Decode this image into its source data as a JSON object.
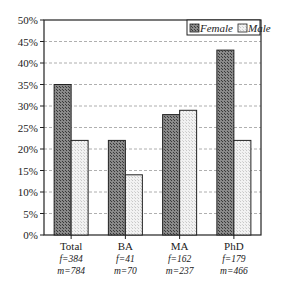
{
  "chart_data": {
    "type": "bar",
    "title": "",
    "xlabel": "",
    "ylabel": "",
    "ylim": [
      0,
      50
    ],
    "yticks": [
      "0%",
      "5%",
      "10%",
      "15%",
      "20%",
      "25%",
      "30%",
      "35%",
      "40%",
      "45%",
      "50%"
    ],
    "grid": true,
    "legend_position": "top-right",
    "categories": [
      "Total",
      "BA",
      "MA",
      "PhD"
    ],
    "category_notes": [
      [
        "f=384",
        "m=784"
      ],
      [
        "f=41",
        "m=70"
      ],
      [
        "f=162",
        "m=237"
      ],
      [
        "f=179",
        "m=466"
      ]
    ],
    "series": [
      {
        "name": "Female",
        "values": [
          35,
          22,
          28,
          43
        ],
        "color": "#6e6e6e"
      },
      {
        "name": "Male",
        "values": [
          22,
          14,
          29,
          22
        ],
        "color": "#e6e6e6"
      }
    ]
  }
}
